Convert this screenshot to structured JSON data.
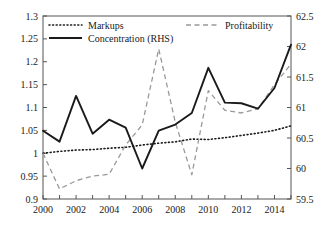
{
  "chart_data": {
    "type": "line",
    "title": "",
    "subtitle": "",
    "xlabel": "",
    "ylabel": "",
    "y2label": "",
    "grid": false,
    "legend_position": "top-inside",
    "x": [
      2000,
      2001,
      2002,
      2003,
      2004,
      2005,
      2006,
      2007,
      2008,
      2009,
      2010,
      2011,
      2012,
      2013,
      2014,
      2015
    ],
    "xlim": [
      2000,
      2015
    ],
    "xticks": [
      2000,
      2001,
      2002,
      2003,
      2004,
      2005,
      2006,
      2007,
      2008,
      2009,
      2010,
      2011,
      2012,
      2013,
      2014,
      2015
    ],
    "xtick_labels": [
      "2000",
      "",
      "2002",
      "",
      "2004",
      "",
      "2006",
      "",
      "2008",
      "",
      "2010",
      "",
      "2012",
      "",
      "2014",
      ""
    ],
    "xtick_labels_shown": [
      "2000",
      "2002",
      "2004",
      "2006",
      "2008",
      "2010",
      "2012",
      "2014"
    ],
    "ylim": [
      0.9,
      1.3
    ],
    "yticks": [
      0.9,
      0.95,
      1.0,
      1.05,
      1.1,
      1.15,
      1.2,
      1.25,
      1.3
    ],
    "ytick_labels": [
      "0.9",
      "0.95",
      "1",
      "1.05",
      "1.1",
      "1.15",
      "1.2",
      "1.25",
      "1.3"
    ],
    "y2lim": [
      59.5,
      62.5
    ],
    "y2ticks": [
      59.5,
      60.0,
      60.5,
      61.0,
      61.5,
      62.0,
      62.5
    ],
    "y2tick_labels": [
      "59.5",
      "60",
      "60.5",
      "61",
      "61.5",
      "62",
      "62.5"
    ],
    "series": [
      {
        "name": "Markups",
        "axis": "left",
        "style": "dotted",
        "color": "#1a1a1a",
        "values": [
          1.0,
          1.004,
          1.007,
          1.008,
          1.011,
          1.013,
          1.018,
          1.022,
          1.025,
          1.031,
          1.03,
          1.034,
          1.039,
          1.044,
          1.05,
          1.06
        ]
      },
      {
        "name": "Profitability",
        "axis": "left",
        "style": "dashed",
        "color": "#999999",
        "values": [
          1.0,
          0.922,
          0.94,
          0.95,
          0.954,
          1.018,
          1.062,
          1.228,
          1.068,
          0.953,
          1.137,
          1.094,
          1.088,
          1.097,
          1.15,
          1.195
        ]
      },
      {
        "name": "Concentration (RHS)",
        "axis": "right",
        "style": "solid",
        "color": "#1a1a1a",
        "values": [
          60.62,
          60.44,
          61.19,
          60.57,
          60.8,
          60.67,
          60.0,
          60.62,
          60.72,
          60.91,
          61.65,
          61.08,
          61.07,
          60.98,
          61.32,
          62.03
        ],
        "values_left_equivalent": [
          1.043,
          1.018,
          1.1225,
          1.0295,
          1.0675,
          1.0455,
          0.9665,
          1.0425,
          1.0565,
          1.0815,
          1.1855,
          1.1095,
          1.1085,
          1.097,
          1.1425,
          1.2395
        ]
      }
    ]
  },
  "legend": {
    "entries": [
      {
        "label": "Markups",
        "style": "dotted",
        "color": "#1a1a1a"
      },
      {
        "label": "Profitability",
        "style": "dashed",
        "color": "#999999"
      },
      {
        "label": "Concentration (RHS)",
        "style": "solid",
        "color": "#1a1a1a"
      }
    ]
  },
  "colors": {
    "axis": "#555555",
    "markups": "#1a1a1a",
    "profitability": "#999999",
    "concentration": "#1a1a1a",
    "background": "#ffffff"
  }
}
